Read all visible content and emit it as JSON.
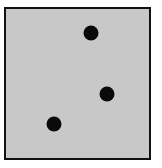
{
  "figure": {
    "background": "#c8c8c8",
    "border_color": "#111111",
    "dot_color": "#0a0a0a",
    "dots": [
      {
        "x": 91,
        "y": 33
      },
      {
        "x": 107,
        "y": 94
      },
      {
        "x": 54,
        "y": 124
      }
    ]
  }
}
